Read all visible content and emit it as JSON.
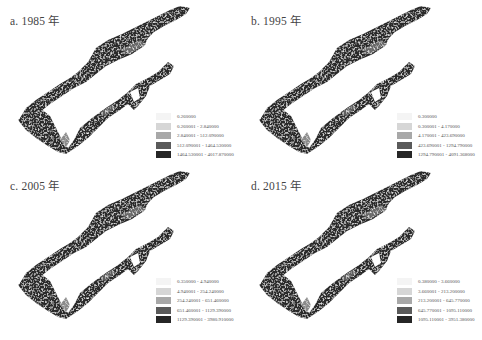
{
  "figure": {
    "panels": [
      {
        "id": "a",
        "title": "a. 1985 年",
        "legend": [
          {
            "label": "0.260000",
            "color": "#f4f4f4"
          },
          {
            "label": "0.260001 - 2.840000",
            "color": "#d6d6d6"
          },
          {
            "label": "2.840001 - 512.090000",
            "color": "#a8a8a8"
          },
          {
            "label": "512.090001 - 1464.530000",
            "color": "#5a5a5a"
          },
          {
            "label": "1464.530001 - 4017.870000",
            "color": "#262626"
          }
        ]
      },
      {
        "id": "b",
        "title": "b. 1995 年",
        "legend": [
          {
            "label": "0.300000",
            "color": "#f4f4f4"
          },
          {
            "label": "0.300001 - 4.170000",
            "color": "#d6d6d6"
          },
          {
            "label": "4.170001 - 423.690000",
            "color": "#a8a8a8"
          },
          {
            "label": "423.690001 - 1294.790000",
            "color": "#5a5a5a"
          },
          {
            "label": "1294.790001 - 4091.368000",
            "color": "#262626"
          }
        ]
      },
      {
        "id": "c",
        "title": "c. 2005 年",
        "legend": [
          {
            "label": "0.350000 - 4.940000",
            "color": "#f4f4f4"
          },
          {
            "label": "4.940001 - 254.240000",
            "color": "#d6d6d6"
          },
          {
            "label": "254.240001 - 651.460000",
            "color": "#a8a8a8"
          },
          {
            "label": "651.460001 - 1129.390000",
            "color": "#5a5a5a"
          },
          {
            "label": "1129.390001 - 3980.910000",
            "color": "#262626"
          }
        ]
      },
      {
        "id": "d",
        "title": "d. 2015 年",
        "legend": [
          {
            "label": "0.380000 - 3.660000",
            "color": "#f4f4f4"
          },
          {
            "label": "3.660001 - 213.200000",
            "color": "#d6d6d6"
          },
          {
            "label": "213.200001 - 645.770000",
            "color": "#a8a8a8"
          },
          {
            "label": "645.770001 - 1095.110000",
            "color": "#5a5a5a"
          },
          {
            "label": "1095.110001 - 3951.380000",
            "color": "#262626"
          }
        ]
      }
    ]
  },
  "colors": {
    "map_fill_dark": "#2a2a2a",
    "map_fill_mid": "#555555",
    "map_highlight": "#9a9a9a",
    "background": "#ffffff"
  }
}
